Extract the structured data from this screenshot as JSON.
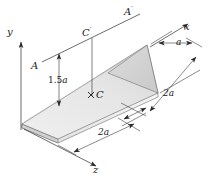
{
  "figure": {
    "colors": {
      "line": "#2b2b2b",
      "plate_top": "#e9e9e9",
      "plate_top_shaded": "#d8d8d8",
      "plate_edge": "#f2f2f2",
      "plate_side": "#cfcfcf",
      "background": "#ffffff",
      "text": "#1b1b1b"
    },
    "axes": [
      {
        "id": "y",
        "label": "y",
        "direction": "up"
      },
      {
        "id": "x",
        "label": "x",
        "direction": "upper-right"
      },
      {
        "id": "z",
        "label": "z",
        "direction": "lower-right"
      }
    ],
    "points": [
      {
        "id": "A",
        "label": "A",
        "kind": "axis-endpoint"
      },
      {
        "id": "A-prime",
        "label": "A",
        "prime": "′",
        "kind": "axis-endpoint"
      },
      {
        "id": "C",
        "label": "C",
        "kind": "centroid",
        "marker": "×"
      },
      {
        "id": "C-prime",
        "label": "C",
        "prime": "′",
        "kind": "centroid-projection"
      }
    ],
    "dimensions": [
      {
        "id": "dim-a",
        "label": "a",
        "value": "a",
        "axis": "x"
      },
      {
        "id": "dim-2a-right",
        "label": "2a",
        "value": "2a",
        "axis": "z"
      },
      {
        "id": "dim-2a-front",
        "label": "2a",
        "value": "2a",
        "axis": "z"
      },
      {
        "id": "dim-1-5a",
        "label": "1.5a",
        "value": "1.5a",
        "axis": "vertical"
      }
    ],
    "labels": {
      "y_axis": "y",
      "x_axis": "x",
      "z_axis": "z",
      "a_point": "A",
      "a_prime_point": "A",
      "a_prime_mark": "′",
      "c_point": "C",
      "c_prime_point": "C",
      "c_prime_mark": "′",
      "c_marker": "×",
      "dim_a": "a",
      "dim_2a_right": "2a",
      "dim_2a_front": "2a",
      "dim_1_5a_number": "1.5",
      "dim_1_5a_unit": "a"
    }
  }
}
